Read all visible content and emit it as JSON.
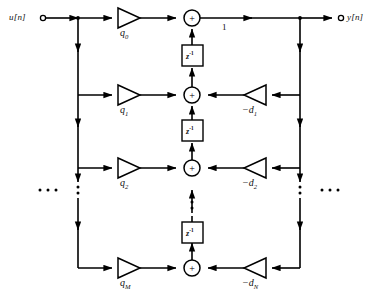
{
  "diagram": {
    "input_label": "u[n]",
    "output_label": "y[n]",
    "output_gain_label": "1",
    "delay_label_base": "z",
    "delay_label_exp": "-1",
    "adder_symbol": "+",
    "stroke_color": "#000000",
    "background_color": "#ffffff",
    "feedforward": [
      {
        "label_base": "q",
        "label_sub": "0"
      },
      {
        "label_base": "q",
        "label_sub": "1"
      },
      {
        "label_base": "q",
        "label_sub": "2"
      },
      {
        "label_base": "q",
        "label_sub": "M"
      }
    ],
    "feedback": [
      {
        "label_base": "−d",
        "label_sub": "1"
      },
      {
        "label_base": "−d",
        "label_sub": "2"
      },
      {
        "label_base": "−d",
        "label_sub": "N"
      }
    ],
    "delays": [
      {
        "base": "z",
        "exp": "-1"
      },
      {
        "base": "z",
        "exp": "-1"
      },
      {
        "base": "z",
        "exp": "-1"
      }
    ],
    "adders": [
      {
        "symbol": "+"
      },
      {
        "symbol": "+"
      },
      {
        "symbol": "+"
      },
      {
        "symbol": "+"
      }
    ],
    "ellipses": {
      "left_bus": "⋮",
      "right_bus": "⋮",
      "center_chain": "⋮",
      "left_row": "⋯",
      "right_row": "⋯"
    }
  }
}
